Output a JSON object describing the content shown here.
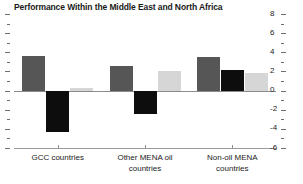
{
  "chart_data": {
    "type": "bar",
    "title": "Performance Within the Middle East and North Africa",
    "xlabel": "",
    "ylabel": "",
    "categories": [
      "GCC countries",
      "Other MENA oil\ncountries",
      "Non-oil MENA\ncountries"
    ],
    "series": [
      {
        "name": "series-1",
        "color": "#565656",
        "values": [
          3.6,
          2.6,
          3.5
        ]
      },
      {
        "name": "series-2",
        "color": "#0d0d0d",
        "values": [
          -4.3,
          -2.4,
          2.1
        ]
      },
      {
        "name": "series-3",
        "color": "#d6d6d6",
        "values": [
          0.3,
          2.0,
          1.8
        ]
      }
    ],
    "ylim": [
      -6,
      8
    ],
    "ytick_values": [
      8,
      6,
      4,
      2,
      0,
      -2,
      -4,
      -6
    ],
    "ytick_labels": [
      "8",
      "6",
      "4",
      "2",
      "0",
      "-2",
      "-4",
      "-6"
    ],
    "yminor_step": 1,
    "grid": false,
    "legend": "none",
    "zero_line": 0,
    "axis_color": "#8c8c8c"
  }
}
